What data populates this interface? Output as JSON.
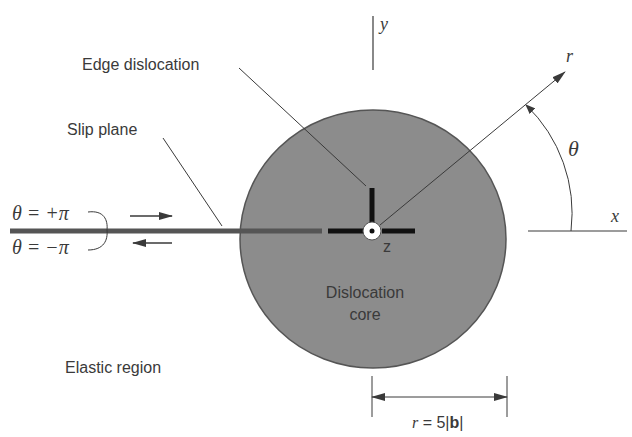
{
  "labels": {
    "y_axis": "y",
    "x_axis": "x",
    "r_axis": "r",
    "theta": "θ",
    "z_axis": "z",
    "edge_dislocation": "Edge dislocation",
    "slip_plane": "Slip plane",
    "theta_plus": "θ = +π",
    "theta_minus": "θ = −π",
    "core_line1": "Dislocation",
    "core_line2": "core",
    "elastic_region": "Elastic region",
    "radius_r": "r",
    "radius_eq": " = 5|",
    "radius_b": "b",
    "radius_close": "|"
  },
  "colors": {
    "core_fill": "#8c8c8c",
    "core_stroke": "#555555",
    "line": "#3a3a3a",
    "slip_plane": "#555555",
    "dislocation_symbol": "#111111"
  }
}
